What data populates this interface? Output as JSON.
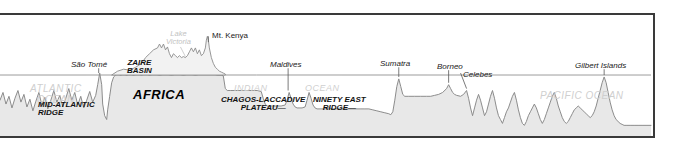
{
  "diagram": {
    "colors": {
      "frame_border": "#3a3a3a",
      "land_fill": "#e8e8e8",
      "profile_line": "#8a8a8a",
      "sea_level_line": "#9a9a9a",
      "ocean_label": "#cfcfcf",
      "feature_label": "#111111",
      "background": "#ffffff"
    },
    "ocean_labels": [
      {
        "id": "atlantic-ocean",
        "line1": "ATLANTIC",
        "line2": "OCEAN"
      },
      {
        "id": "indian-ocean",
        "word1": "INDIAN",
        "word2": "OCEAN"
      },
      {
        "id": "pacific-ocean",
        "text": "PACIFIC OCEAN"
      }
    ],
    "landmass_labels": [
      {
        "id": "africa",
        "text": "AFRICA"
      }
    ],
    "feature_labels": [
      {
        "id": "mid-atlantic-ridge",
        "line1": "MID-ATLANTIC",
        "line2": "RIDGE"
      },
      {
        "id": "zaire-basin",
        "line1": "ZAIRE",
        "line2": "BASIN"
      },
      {
        "id": "chagos-laccadive-plateau",
        "line1": "CHAGOS-LACCADIVE",
        "line2": "PLATEAU—"
      },
      {
        "id": "ninety-east-ridge",
        "line1": "NINETY EAST",
        "line2": "RIDGE—"
      }
    ],
    "point_labels": [
      {
        "id": "sao-tome",
        "text": "São Tomé"
      },
      {
        "id": "lake-victoria",
        "line1": "Lake",
        "line2": "Victoria"
      },
      {
        "id": "mt-kenya",
        "text": "Mt. Kenya"
      },
      {
        "id": "maldives",
        "text": "Maldives"
      },
      {
        "id": "sumatra",
        "text": "Sumatra"
      },
      {
        "id": "borneo",
        "text": "Borneo"
      },
      {
        "id": "celebes",
        "text": "Celebes"
      },
      {
        "id": "gilbert-islands",
        "text": "Gilbert Islands"
      }
    ]
  }
}
